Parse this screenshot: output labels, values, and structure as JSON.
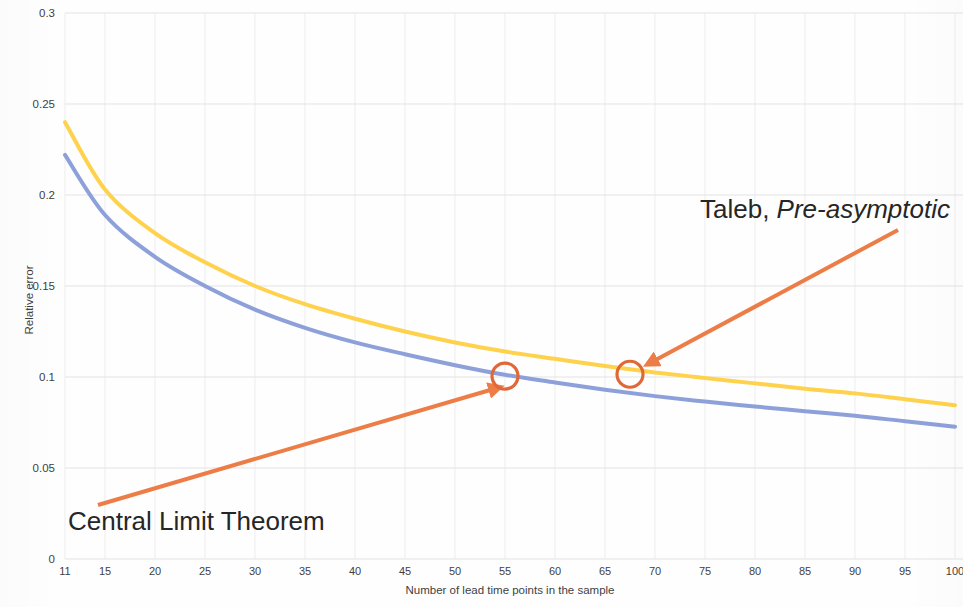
{
  "chart_data": {
    "type": "line",
    "title": "",
    "xlabel": "Number of lead time points in the sample",
    "ylabel": "Relative error",
    "xlim": [
      11,
      100
    ],
    "ylim": [
      0,
      0.3
    ],
    "grid": true,
    "legend_position": "none",
    "xticks": [
      11,
      15,
      20,
      25,
      30,
      35,
      40,
      45,
      50,
      55,
      60,
      65,
      70,
      75,
      80,
      85,
      90,
      95,
      100
    ],
    "xtick_labels": [
      "11",
      "15",
      "20",
      "25",
      "30",
      "35",
      "40",
      "45",
      "50",
      "55",
      "60",
      "65",
      "70",
      "75",
      "80",
      "85",
      "90",
      "95",
      "100"
    ],
    "yticks": [
      0,
      0.05,
      0.1,
      0.15,
      0.2,
      0.25,
      0.3
    ],
    "ytick_labels": [
      "0",
      "0.05",
      "0.1",
      "0.15",
      "0.2",
      "0.25",
      "0.3"
    ],
    "x": [
      11,
      15,
      20,
      25,
      30,
      35,
      40,
      45,
      50,
      55,
      60,
      65,
      70,
      75,
      80,
      85,
      90,
      95,
      100
    ],
    "series": [
      {
        "name": "Taleb, Pre-asymptotic",
        "color": "#FFD24D",
        "values": [
          0.24,
          0.203,
          0.179,
          0.163,
          0.15,
          0.14,
          0.132,
          0.125,
          0.119,
          0.114,
          0.11,
          0.106,
          0.1025,
          0.0995,
          0.0965,
          0.0935,
          0.091,
          0.0878,
          0.0845
        ]
      },
      {
        "name": "Central Limit Theorem",
        "color": "#8EA0DA",
        "values": [
          0.222,
          0.189,
          0.166,
          0.15,
          0.137,
          0.127,
          0.119,
          0.1125,
          0.1065,
          0.1012,
          0.097,
          0.093,
          0.0895,
          0.0865,
          0.0838,
          0.0812,
          0.0787,
          0.0757,
          0.0727
        ]
      }
    ],
    "annotations": [
      {
        "id": "clt",
        "label": "Central Limit Theorem",
        "label_plain": "Central Limit Theorem",
        "label_italic_part": "",
        "marker_x": 55,
        "marker_y": 0.1005,
        "marker_color": "#E06836",
        "arrow_color": "#ED7D47",
        "arrow_from": [
          98,
          505
        ],
        "arrow_to": [
          497,
          388
        ],
        "text_pos": [
          68,
          530
        ]
      },
      {
        "id": "taleb",
        "label": "Taleb, Pre-asymptotic",
        "label_plain": "Taleb, ",
        "label_italic_part": "Pre-asymptotic",
        "marker_x": 67.5,
        "marker_y": 0.1015,
        "marker_color": "#E06836",
        "arrow_color": "#ED7D47",
        "arrow_from": [
          898,
          230
        ],
        "arrow_to": [
          650,
          363
        ],
        "text_pos": [
          700,
          218
        ]
      }
    ]
  },
  "plot": {
    "left_px": 65,
    "right_px": 955,
    "top_px": 13,
    "bottom_px": 559
  },
  "colors": {
    "yellow_series": "#FFD24D",
    "blue_series": "#8EA0DA",
    "annotation_orange": "#ED7D47",
    "marker_orange": "#E06836",
    "grid": "#e3e3e3",
    "text": "#3f3f3f"
  }
}
